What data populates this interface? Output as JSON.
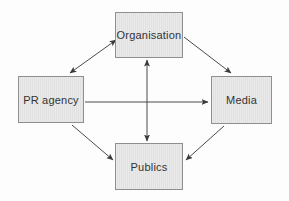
{
  "diagram": {
    "nodes": {
      "organisation": {
        "label": "Organisation",
        "position": "top-center"
      },
      "pr_agency": {
        "label": "PR agency",
        "position": "middle-left"
      },
      "media": {
        "label": "Media",
        "position": "middle-right"
      },
      "publics": {
        "label": "Publics",
        "position": "bottom-center"
      }
    },
    "edges": [
      {
        "from": "pr_agency",
        "to": "organisation",
        "direction": "two-way"
      },
      {
        "from": "organisation",
        "to": "media",
        "direction": "one-way"
      },
      {
        "from": "pr_agency",
        "to": "media",
        "direction": "one-way"
      },
      {
        "from": "organisation",
        "to": "publics",
        "direction": "two-way"
      },
      {
        "from": "pr_agency",
        "to": "publics",
        "direction": "one-way"
      },
      {
        "from": "media",
        "to": "publics",
        "direction": "one-way"
      }
    ],
    "colors": {
      "background": "#fdfdfd",
      "box_fill": "#e4e4e4",
      "box_border": "#8f8f8f",
      "arrow_line": "#4a4a4a",
      "label_text": "#333333"
    }
  }
}
